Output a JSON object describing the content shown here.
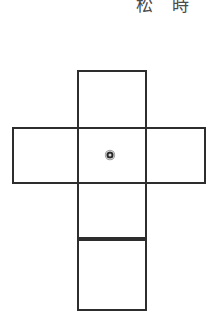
{
  "page": {
    "background_color": "#ffffff",
    "width": 215,
    "height": 330
  },
  "header": {
    "kanji_1": "松",
    "kanji_2": "時",
    "text_color": "#4a4a4a"
  },
  "figure": {
    "name": "cube-net-cross-diagram",
    "line_color": "#2d2d2d",
    "fill_color": "#ffffff",
    "faces": [
      {
        "id": "top",
        "label": "",
        "x": 78,
        "y": 71,
        "w": 68,
        "h": 57
      },
      {
        "id": "left",
        "label": "",
        "x": 13,
        "y": 128,
        "w": 65,
        "h": 55
      },
      {
        "id": "center",
        "label": "",
        "x": 78,
        "y": 128,
        "w": 68,
        "h": 55
      },
      {
        "id": "right",
        "label": "",
        "x": 146,
        "y": 128,
        "w": 59,
        "h": 55
      },
      {
        "id": "lower-middle",
        "label": "",
        "x": 78,
        "y": 183,
        "w": 68,
        "h": 55
      },
      {
        "id": "bottom",
        "label": "",
        "x": 78,
        "y": 240,
        "w": 68,
        "h": 70
      }
    ],
    "center_marker": {
      "name": "center-point-marker",
      "x": 110,
      "y": 155,
      "radius": 5,
      "color": "#2a2a2a"
    }
  }
}
